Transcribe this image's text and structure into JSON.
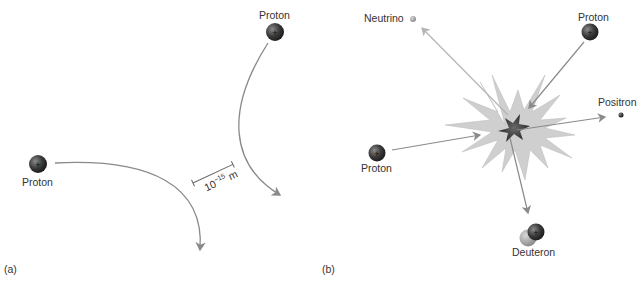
{
  "panel_a": {
    "label": "(a)",
    "proton_left": "Proton",
    "proton_top": "Proton",
    "scale_base": "10",
    "scale_exp": "−15",
    "scale_unit": "m"
  },
  "panel_b": {
    "label": "(b)",
    "neutrino": "Neutrino",
    "proton_top": "Proton",
    "positron": "Positron",
    "proton_left": "Proton",
    "deuteron": "Deuteron"
  },
  "colors": {
    "arrow": "#8a8a8a",
    "neutrino_arrow": "#b5b5b5",
    "particle": "#3a3a3a",
    "burst": "#cfcfcf",
    "core": "#3c3c3c"
  }
}
